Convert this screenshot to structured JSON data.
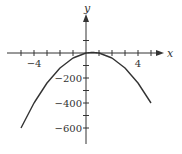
{
  "chart_data": {
    "type": "line",
    "title": "",
    "xlabel": "x",
    "ylabel": "y",
    "xlim": [
      -5,
      5
    ],
    "ylim": [
      -650,
      100
    ],
    "x_ticks": [
      -5,
      -4,
      -3,
      -2,
      -1,
      0,
      1,
      2,
      3,
      4,
      5
    ],
    "x_tick_labels": {
      "-4": "−4",
      "4": "4"
    },
    "y_ticks": [
      100,
      0,
      -100,
      -200,
      -300,
      -400,
      -500,
      -600
    ],
    "y_tick_labels": {
      "-200": "−200",
      "-400": "−400",
      "-600": "−600"
    },
    "grid": false,
    "series": [
      {
        "name": "curve",
        "x": [
          -5,
          -4,
          -3,
          -2,
          -1,
          0,
          0.5,
          1,
          2,
          3,
          4,
          5
        ],
        "y": [
          -600,
          -400,
          -240,
          -120,
          -40,
          0,
          5,
          0,
          -40,
          -120,
          -240,
          -400
        ]
      }
    ],
    "color": "#333333"
  }
}
